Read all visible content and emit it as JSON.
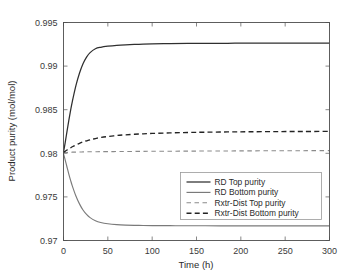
{
  "chart_data": {
    "type": "line",
    "title": "",
    "xlabel": "Time (h)",
    "ylabel": "Product purity (mol/mol)",
    "xlim": [
      0,
      300
    ],
    "ylim": [
      0.97,
      0.995
    ],
    "xticks": [
      0,
      50,
      100,
      150,
      200,
      250,
      300
    ],
    "xticklabels": [
      "0",
      "50",
      "100",
      "150",
      "200",
      "250",
      "300"
    ],
    "yticks": [
      0.97,
      0.975,
      0.98,
      0.985,
      0.99,
      0.995
    ],
    "yticklabels": [
      "0.97",
      "0.975",
      "0.98",
      "0.985",
      "0.99",
      "0.995"
    ],
    "grid": false,
    "legend_position": "lower right",
    "x": [
      0,
      2,
      4,
      6,
      8,
      10,
      14,
      18,
      22,
      26,
      30,
      36,
      42,
      50,
      60,
      70,
      85,
      100,
      120,
      140,
      160,
      185,
      210,
      240,
      270,
      300
    ],
    "series": [
      {
        "name": "RD Top purity",
        "color": "#2f2f2f",
        "style": "solid",
        "width": 1.25,
        "values": [
          0.98012,
          0.98128,
          0.98255,
          0.98378,
          0.98492,
          0.98596,
          0.98776,
          0.98918,
          0.99027,
          0.99103,
          0.99155,
          0.99199,
          0.99216,
          0.99228,
          0.99238,
          0.99244,
          0.9925,
          0.99254,
          0.99258,
          0.9926,
          0.99261,
          0.99262,
          0.99263,
          0.99263,
          0.99264,
          0.99264
        ]
      },
      {
        "name": "RD Bottom purity",
        "color": "#7a7a7a",
        "style": "solid",
        "width": 1.15,
        "values": [
          0.97996,
          0.9792,
          0.9784,
          0.97762,
          0.9769,
          0.97624,
          0.9751,
          0.9742,
          0.9735,
          0.97299,
          0.97262,
          0.97227,
          0.97207,
          0.97192,
          0.97182,
          0.97177,
          0.97173,
          0.97171,
          0.9717,
          0.97169,
          0.97169,
          0.97168,
          0.97168,
          0.97168,
          0.97168,
          0.97168
        ]
      },
      {
        "name": "Rxtr-Dist Top purity",
        "color": "#8a8a8a",
        "style": "dashed",
        "width": 1.1,
        "values": [
          0.98006,
          0.98008,
          0.9801,
          0.98011,
          0.98012,
          0.98013,
          0.98014,
          0.98015,
          0.98016,
          0.98017,
          0.98017,
          0.98018,
          0.98019,
          0.98019,
          0.9802,
          0.98021,
          0.98022,
          0.98023,
          0.98024,
          0.98025,
          0.98026,
          0.98027,
          0.98028,
          0.98029,
          0.9803,
          0.98031
        ]
      },
      {
        "name": "Rxtr-Dist Bottom purity",
        "color": "#232323",
        "style": "dashed",
        "width": 1.35,
        "values": [
          0.9801,
          0.98024,
          0.98038,
          0.98051,
          0.98063,
          0.98075,
          0.98096,
          0.98114,
          0.9813,
          0.98143,
          0.98155,
          0.98169,
          0.98181,
          0.98193,
          0.98204,
          0.98212,
          0.98221,
          0.98228,
          0.98234,
          0.98239,
          0.98242,
          0.98245,
          0.98247,
          0.98249,
          0.9825,
          0.98251
        ]
      }
    ]
  }
}
